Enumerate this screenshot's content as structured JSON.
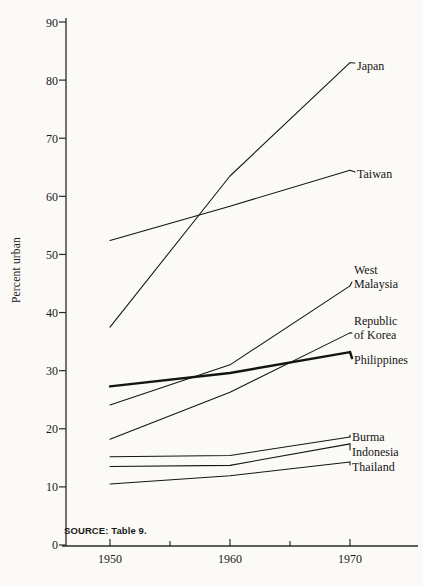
{
  "figure": {
    "ylabel": "Percent urban",
    "source_note": "SOURCE: Table 9."
  },
  "axes": {
    "y_ticks": [
      "0",
      "10",
      "20",
      "30",
      "40",
      "50",
      "60",
      "70",
      "80",
      "90"
    ],
    "x_ticks": [
      "1950",
      "1960",
      "1970"
    ]
  },
  "labels": {
    "japan": "Japan",
    "taiwan": "Taiwan",
    "west": "West",
    "malaysia": "Malaysia",
    "republic": "Republic",
    "of_korea": "of Korea",
    "philippines": "Philippines",
    "burma": "Burma",
    "indonesia": "Indonesia",
    "thailand": "Thailand"
  },
  "chart_data": {
    "type": "line",
    "title": "",
    "xlabel": "",
    "ylabel": "Percent urban",
    "x": [
      1950,
      1960,
      1970
    ],
    "xlim": [
      1946,
      1974
    ],
    "ylim": [
      0,
      92
    ],
    "yticks": [
      0,
      10,
      20,
      30,
      40,
      50,
      60,
      70,
      80,
      90
    ],
    "xticks": [
      1950,
      1960,
      1970
    ],
    "x_minor_ticks": [
      1955,
      1965
    ],
    "grid": false,
    "legend": "right-inline-labels",
    "series": [
      {
        "name": "Japan",
        "values": [
          37.5,
          63.5,
          83.0
        ],
        "emphasis": false
      },
      {
        "name": "Taiwan",
        "values": [
          52.4,
          58.3,
          64.5
        ],
        "emphasis": false
      },
      {
        "name": "West Malaysia",
        "values": [
          24.1,
          31.0,
          44.6
        ],
        "emphasis": false
      },
      {
        "name": "Republic of Korea",
        "values": [
          18.2,
          26.3,
          36.5
        ],
        "emphasis": false
      },
      {
        "name": "Philippines",
        "values": [
          27.3,
          29.6,
          33.2
        ],
        "emphasis": true
      },
      {
        "name": "Burma",
        "values": [
          15.2,
          15.4,
          18.6
        ],
        "emphasis": false
      },
      {
        "name": "Indonesia",
        "values": [
          13.5,
          13.7,
          17.4
        ],
        "emphasis": false
      },
      {
        "name": "Thailand",
        "values": [
          10.5,
          11.9,
          14.3
        ],
        "emphasis": false
      }
    ]
  }
}
